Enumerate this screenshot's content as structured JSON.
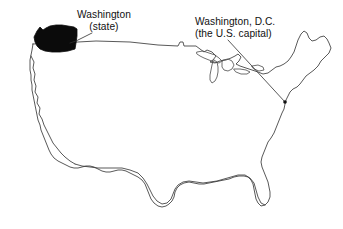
{
  "figure": {
    "type": "annotated-map",
    "background_color": "#ffffff",
    "outline_color": "#3b3b3b",
    "highlight_color": "#0b0b0b",
    "width": 343,
    "height": 229
  },
  "annotations": {
    "state": {
      "name": "washington-state",
      "line1": "Washington",
      "line2": "(state)",
      "text_x": 107,
      "text_y": 9,
      "leader_from_x": 92,
      "leader_from_y": 33,
      "leader_to_x": 70,
      "leader_to_y": 43,
      "highlight_fill": "#0b0b0b"
    },
    "capital": {
      "name": "washington-dc",
      "line1": "Washington, D.C.",
      "line2": "(the U.S. capital)",
      "text_x": 195,
      "text_y": 16,
      "leader_from_x": 228,
      "leader_from_y": 40,
      "leader_to_x": 285,
      "leader_to_y": 102,
      "marker_x": 285,
      "marker_y": 102
    }
  },
  "map_features": {
    "highlighted_state": "Washington",
    "marked_city": "Washington, D.C.",
    "includes_great_lakes": true,
    "includes_florida": true,
    "includes_maine": true
  }
}
